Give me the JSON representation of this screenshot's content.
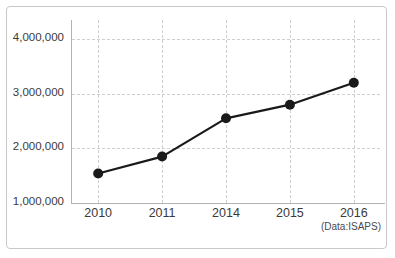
{
  "chart_data": {
    "type": "line",
    "title": "",
    "subtitle": "",
    "xlabel": "",
    "ylabel": "",
    "categories": [
      "2010",
      "2011",
      "2014",
      "2015",
      "2016"
    ],
    "x": [
      2010,
      2011,
      2014,
      2015,
      2016
    ],
    "values": [
      1540000,
      1850000,
      2550000,
      2800000,
      3200000
    ],
    "series": [
      {
        "name": "",
        "values": [
          1540000,
          1850000,
          2550000,
          2800000,
          3200000
        ]
      }
    ],
    "ylim": [
      1000000,
      4350000
    ],
    "y_ticks": [
      1000000,
      2000000,
      3000000,
      4000000
    ],
    "y_tick_labels": [
      "1,000,000",
      "2,000,000",
      "3,000,000",
      "4,000,000"
    ],
    "x_tick_labels": [
      "2010",
      "2011",
      "2014",
      "2015",
      "2016"
    ],
    "grid": true,
    "grid_style": "dashed",
    "legend": false,
    "legend_position": "none",
    "annotations": [
      "(Data:ISAPS)"
    ],
    "marker": "filled-circle",
    "line_color": "#1a1a1a",
    "marker_color": "#1a1a1a",
    "grid_color": "#cfcfcf",
    "axis_color": "#b3b3b3",
    "border_color": "#c9c9c9",
    "background": "#ffffff"
  },
  "axis": {
    "y_labels": [
      {
        "value": 4000000,
        "text": "4,000,000"
      },
      {
        "value": 3000000,
        "text": "3,000,000"
      },
      {
        "value": 2000000,
        "text": "2,000,000"
      },
      {
        "value": 1000000,
        "text": "1,000,000"
      }
    ],
    "x_labels": [
      {
        "value": 2010,
        "text": "2010"
      },
      {
        "value": 2011,
        "text": "2011"
      },
      {
        "value": 2014,
        "text": "2014"
      },
      {
        "value": 2015,
        "text": "2015"
      },
      {
        "value": 2016,
        "text": "2016"
      }
    ]
  },
  "footer": {
    "source_note": "(Data:ISAPS)"
  }
}
